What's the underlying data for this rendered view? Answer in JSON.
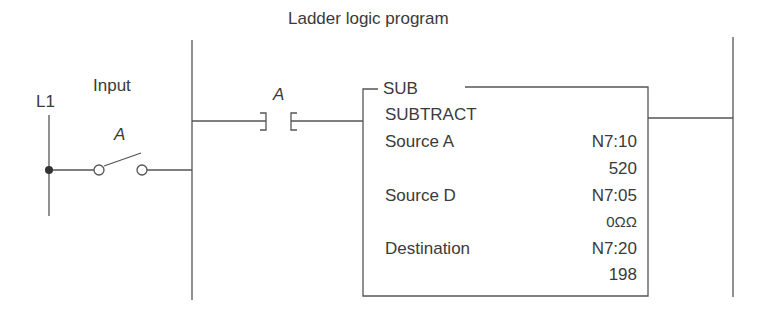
{
  "diagram": {
    "title": "Ladder logic program",
    "input_side": {
      "rail_label": "L1",
      "input_label": "Input",
      "switch_label": "A"
    },
    "program_side": {
      "contact_label": "A",
      "instruction": {
        "mnemonic": "SUB",
        "name": "SUBTRACT",
        "rows": [
          {
            "label": "Source A",
            "address": "N7:10",
            "value": "520"
          },
          {
            "label": "Source D",
            "address": "N7:05",
            "value": "0ΩΩ"
          },
          {
            "label": "Destination",
            "address": "N7:20",
            "value": "198"
          }
        ]
      }
    },
    "colors": {
      "line": "#555555",
      "text": "#3a3a3a"
    }
  }
}
